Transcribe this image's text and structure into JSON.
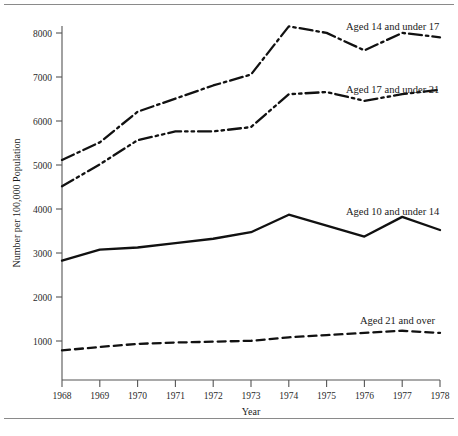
{
  "figure": {
    "has_top_rule": true,
    "has_bottom_rule": true
  },
  "chart_data": {
    "type": "line",
    "title": "",
    "xlabel": "Year",
    "ylabel": "Number per 100,000 Population",
    "x": [
      1968,
      1969,
      1970,
      1971,
      1972,
      1973,
      1974,
      1975,
      1976,
      1977,
      1978
    ],
    "xtick_labels": [
      "1968",
      "1969",
      "1970",
      "1971",
      "1972",
      "1973",
      "1974",
      "1975",
      "1976",
      "1977",
      "1978"
    ],
    "ytick_labels": [
      "1000",
      "2000",
      "3000",
      "4000",
      "5000",
      "6000",
      "7000",
      "8000"
    ],
    "yticks": [
      1000,
      2000,
      3000,
      4000,
      5000,
      6000,
      7000,
      8000
    ],
    "xlim": [
      1968,
      1978
    ],
    "ylim": [
      75,
      8450
    ],
    "grid": false,
    "legend_position": "inline-right",
    "series": [
      {
        "name": "Aged 14 and under 17",
        "label": "Aged 14 and under 17",
        "style": "dash-dot",
        "color": "#111111",
        "values": [
          5100,
          5500,
          6200,
          6500,
          6800,
          7050,
          8150,
          8000,
          7600,
          8000,
          7900
        ]
      },
      {
        "name": "Aged 17 and under 21",
        "label": "Aged 17 and under 21",
        "style": "dash-dot-dot",
        "color": "#111111",
        "values": [
          4500,
          5000,
          5550,
          5750,
          5750,
          5850,
          6600,
          6650,
          6450,
          6600,
          6700
        ]
      },
      {
        "name": "Aged 10 and under 14",
        "label": "Aged 10 and under 14",
        "style": "solid",
        "color": "#111111",
        "values": [
          2800,
          3050,
          3100,
          3200,
          3300,
          3450,
          3850,
          3600,
          3350,
          3800,
          3500
        ]
      },
      {
        "name": "Aged 21 and over",
        "label": "Aged 21 and over",
        "style": "dashed",
        "color": "#111111",
        "values": [
          750,
          830,
          900,
          930,
          950,
          970,
          1050,
          1100,
          1150,
          1200,
          1150
        ]
      }
    ]
  },
  "annotations": {
    "series_labels": [
      {
        "text": "Aged 14 and under 17",
        "x": 346,
        "y": 30
      },
      {
        "text": "Aged 17 and under 21",
        "x": 346,
        "y": 93
      },
      {
        "text": "Aged 10 and under 14",
        "x": 346,
        "y": 215
      },
      {
        "text": "Aged 21 and over",
        "x": 360,
        "y": 324
      }
    ]
  }
}
